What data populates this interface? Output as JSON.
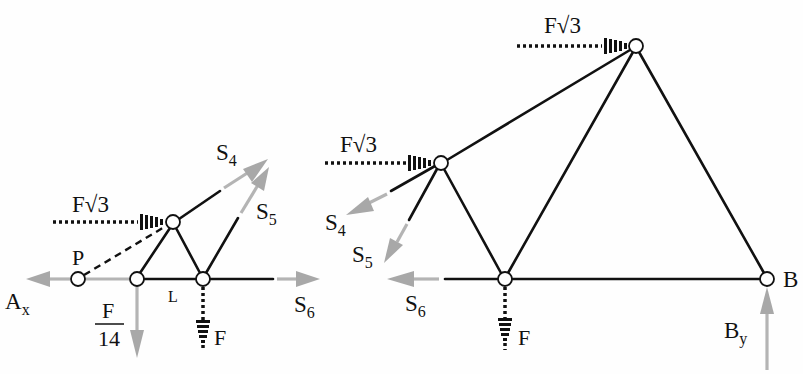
{
  "figure": {
    "colors": {
      "member": "#111111",
      "reaction_arrow": "#a8a8a8",
      "background": "#fefefe"
    },
    "left_diagram": {
      "labels": {
        "load_horizontal": "F√3",
        "s4": "S",
        "s4_sub": "4",
        "s5": "S",
        "s5_sub": "5",
        "s6": "S",
        "s6_sub": "6",
        "point_p": "P",
        "ax": "A",
        "ax_sub": "x",
        "frac_num": "F",
        "frac_den": "14",
        "length": "L",
        "load_vertical": "F"
      },
      "nodes": [
        {
          "id": "P",
          "x": 78,
          "y": 279
        },
        {
          "id": "A",
          "x": 137,
          "y": 279
        },
        {
          "id": "top",
          "x": 173,
          "y": 222
        },
        {
          "id": "C",
          "x": 203,
          "y": 279
        }
      ]
    },
    "right_diagram": {
      "labels": {
        "load_top": "F√3",
        "load_mid": "F√3",
        "s4": "S",
        "s4_sub": "4",
        "s5": "S",
        "s5_sub": "5",
        "s6": "S",
        "s6_sub": "6",
        "load_vertical": "F",
        "support_b": "B",
        "by": "B",
        "by_sub": "y"
      },
      "nodes": [
        {
          "id": "mid",
          "x": 441,
          "y": 163
        },
        {
          "id": "apex",
          "x": 636,
          "y": 46
        },
        {
          "id": "bottom",
          "x": 505,
          "y": 279
        },
        {
          "id": "B",
          "x": 767,
          "y": 279
        }
      ]
    }
  }
}
